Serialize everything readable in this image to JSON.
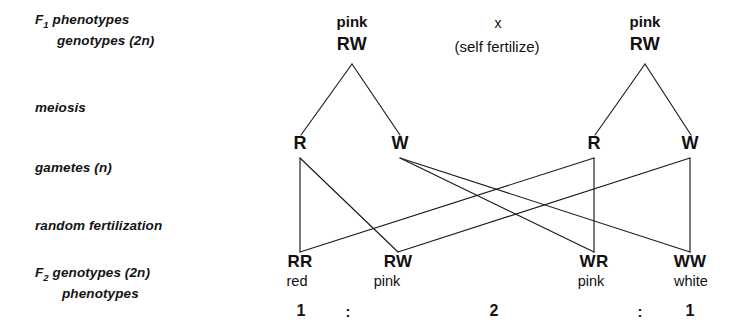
{
  "diagram": {
    "line_color": "#1a1a1a",
    "background": "#ffffff",
    "row_labels": [
      {
        "prefix": "F",
        "subscript": "1",
        "line1": "phenotypes",
        "line2": "genotypes (2n)"
      },
      {
        "prefix": "",
        "subscript": "",
        "line1": "meiosis",
        "line2": ""
      },
      {
        "prefix": "",
        "subscript": "",
        "line1": "gametes (n)",
        "line2": ""
      },
      {
        "prefix": "",
        "subscript": "",
        "line1": "random fertilization",
        "line2": ""
      },
      {
        "prefix": "F",
        "subscript": "2",
        "line1": "genotypes (2n)",
        "line2": "phenotypes"
      }
    ],
    "parents": {
      "left": {
        "phenotype": "pink",
        "genotype": "RW"
      },
      "right": {
        "phenotype": "pink",
        "genotype": "RW"
      },
      "cross_symbol": "x",
      "cross_note": "(self fertilize)"
    },
    "gametes": [
      {
        "allele": "R"
      },
      {
        "allele": "W"
      },
      {
        "allele": "R"
      },
      {
        "allele": "W"
      }
    ],
    "offspring": [
      {
        "genotype": "RR",
        "phenotype": "red"
      },
      {
        "genotype": "RW",
        "phenotype": "pink"
      },
      {
        "genotype": "WR",
        "phenotype": "pink"
      },
      {
        "genotype": "WW",
        "phenotype": "white"
      }
    ],
    "ratio": {
      "first": "1",
      "colon1": ":",
      "second": "2",
      "colon2": ":",
      "third": "1"
    }
  }
}
